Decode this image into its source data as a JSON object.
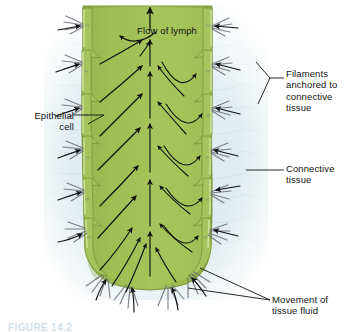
{
  "figure": {
    "caption": "FIGURE 14.2"
  },
  "labels": {
    "flow_of_lymph": "Flow of lymph",
    "epithelial_cell": "Epithelial\ncell",
    "filaments": "Filaments\nanchored to\nconnective\ntissue",
    "connective_tissue": "Connective\ntissue",
    "movement_of_tissue_fluid": "Movement of\ntissue fluid"
  },
  "colors": {
    "vessel_green_dark": "#8fae48",
    "vessel_green_mid": "#9cbb53",
    "vessel_green_light": "#aecb68",
    "vessel_edge": "#d8e4a8",
    "vessel_outline": "#7d9a3c",
    "background_tissue": "#e4eef2",
    "filament_gray": "#6f6f78",
    "arrow_black": "#101010",
    "label_text": "#141414",
    "page_background": "#ffffff"
  }
}
